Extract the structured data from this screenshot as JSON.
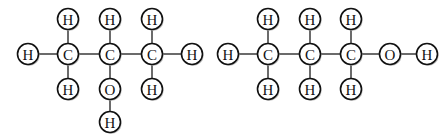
{
  "figure": {
    "background_color": "#ffffff",
    "bond_color": "#3a3a3a",
    "atom_outline_color": "#111111",
    "atom_fill_color": "#ffffff",
    "label_color": "#111111",
    "atom_radius": 10.5
  },
  "structures": [
    {
      "id": "left-structure",
      "name": "propan-2-ol-skeletal-ball-diagram",
      "atoms": [
        {
          "id": "L-H-left",
          "label": "H",
          "element": "H",
          "x": 28,
          "y": 54
        },
        {
          "id": "L-C1",
          "label": "C",
          "element": "C",
          "x": 68,
          "y": 54
        },
        {
          "id": "L-C2",
          "label": "C",
          "element": "C",
          "x": 110,
          "y": 54
        },
        {
          "id": "L-C3",
          "label": "C",
          "element": "C",
          "x": 152,
          "y": 54
        },
        {
          "id": "L-H-right",
          "label": "H",
          "element": "H",
          "x": 192,
          "y": 54
        },
        {
          "id": "L-H-top-1",
          "label": "H",
          "element": "H",
          "x": 68,
          "y": 19
        },
        {
          "id": "L-H-top-2",
          "label": "H",
          "element": "H",
          "x": 110,
          "y": 19
        },
        {
          "id": "L-H-top-3",
          "label": "H",
          "element": "H",
          "x": 152,
          "y": 19
        },
        {
          "id": "L-H-bot-1",
          "label": "H",
          "element": "H",
          "x": 68,
          "y": 89
        },
        {
          "id": "L-O",
          "label": "O",
          "element": "O",
          "x": 110,
          "y": 89
        },
        {
          "id": "L-H-bot-3",
          "label": "H",
          "element": "H",
          "x": 152,
          "y": 89
        },
        {
          "id": "L-H-hydroxyl",
          "label": "H",
          "element": "H",
          "x": 110,
          "y": 122
        }
      ],
      "bonds": [
        {
          "from": "L-H-left",
          "to": "L-C1"
        },
        {
          "from": "L-C1",
          "to": "L-C2"
        },
        {
          "from": "L-C2",
          "to": "L-C3"
        },
        {
          "from": "L-C3",
          "to": "L-H-right"
        },
        {
          "from": "L-H-top-1",
          "to": "L-C1"
        },
        {
          "from": "L-H-top-2",
          "to": "L-C2"
        },
        {
          "from": "L-H-top-3",
          "to": "L-C3"
        },
        {
          "from": "L-C1",
          "to": "L-H-bot-1"
        },
        {
          "from": "L-C2",
          "to": "L-O"
        },
        {
          "from": "L-C3",
          "to": "L-H-bot-3"
        },
        {
          "from": "L-O",
          "to": "L-H-hydroxyl"
        }
      ]
    },
    {
      "id": "right-structure",
      "name": "propan-1-ol-skeletal-ball-diagram",
      "atoms": [
        {
          "id": "R-H-left",
          "label": "H",
          "element": "H",
          "x": 228,
          "y": 54
        },
        {
          "id": "R-C1",
          "label": "C",
          "element": "C",
          "x": 268,
          "y": 54
        },
        {
          "id": "R-C2",
          "label": "C",
          "element": "C",
          "x": 310,
          "y": 54
        },
        {
          "id": "R-C3",
          "label": "C",
          "element": "C",
          "x": 351,
          "y": 54
        },
        {
          "id": "R-O",
          "label": "O",
          "element": "O",
          "x": 390,
          "y": 54
        },
        {
          "id": "R-H-right",
          "label": "H",
          "element": "H",
          "x": 427,
          "y": 54
        },
        {
          "id": "R-H-top-1",
          "label": "H",
          "element": "H",
          "x": 268,
          "y": 19
        },
        {
          "id": "R-H-top-2",
          "label": "H",
          "element": "H",
          "x": 310,
          "y": 19
        },
        {
          "id": "R-H-top-3",
          "label": "H",
          "element": "H",
          "x": 351,
          "y": 19
        },
        {
          "id": "R-H-bot-1",
          "label": "H",
          "element": "H",
          "x": 268,
          "y": 89
        },
        {
          "id": "R-H-bot-2",
          "label": "H",
          "element": "H",
          "x": 310,
          "y": 89
        },
        {
          "id": "R-H-bot-3",
          "label": "H",
          "element": "H",
          "x": 351,
          "y": 89
        }
      ],
      "bonds": [
        {
          "from": "R-H-left",
          "to": "R-C1"
        },
        {
          "from": "R-C1",
          "to": "R-C2"
        },
        {
          "from": "R-C2",
          "to": "R-C3"
        },
        {
          "from": "R-C3",
          "to": "R-O"
        },
        {
          "from": "R-O",
          "to": "R-H-right"
        },
        {
          "from": "R-H-top-1",
          "to": "R-C1"
        },
        {
          "from": "R-H-top-2",
          "to": "R-C2"
        },
        {
          "from": "R-H-top-3",
          "to": "R-C3"
        },
        {
          "from": "R-C1",
          "to": "R-H-bot-1"
        },
        {
          "from": "R-C2",
          "to": "R-H-bot-2"
        },
        {
          "from": "R-C3",
          "to": "R-H-bot-3"
        }
      ]
    }
  ]
}
